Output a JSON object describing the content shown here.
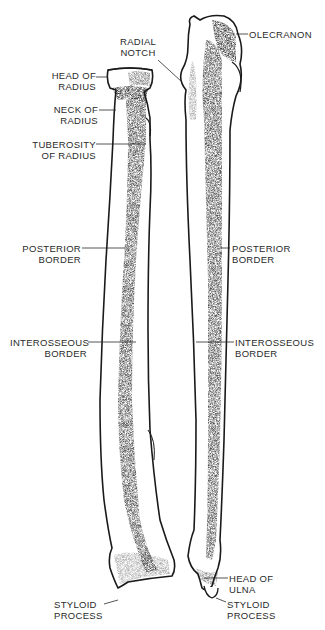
{
  "figure": {
    "colors": {
      "background": "#ffffff",
      "ink": "#1a1a1a",
      "label": "#2a2a2a"
    }
  },
  "labels": {
    "radial_notch": [
      "RADIAL",
      "NOTCH"
    ],
    "olecranon": [
      "OLECRANON"
    ],
    "head_of_radius": [
      "HEAD OF",
      "RADIUS"
    ],
    "neck_of_radius": [
      "NECK OF",
      "RADIUS"
    ],
    "tuberosity_of_radius": [
      "TUBEROSITY",
      "OF RADIUS"
    ],
    "posterior_border_left": [
      "POSTERIOR",
      "BORDER"
    ],
    "posterior_border_right": [
      "POSTERIOR",
      "BORDER"
    ],
    "interosseous_border_left": [
      "INTEROSSEOUS",
      "BORDER"
    ],
    "interosseous_border_right": [
      "INTEROSSEOUS",
      "BORDER"
    ],
    "head_of_ulna": [
      "HEAD OF",
      "ULNA"
    ],
    "styloid_process_left": [
      "STYLOID",
      "PROCESS"
    ],
    "styloid_process_right": [
      "STYLOID",
      "PROCESS"
    ]
  }
}
